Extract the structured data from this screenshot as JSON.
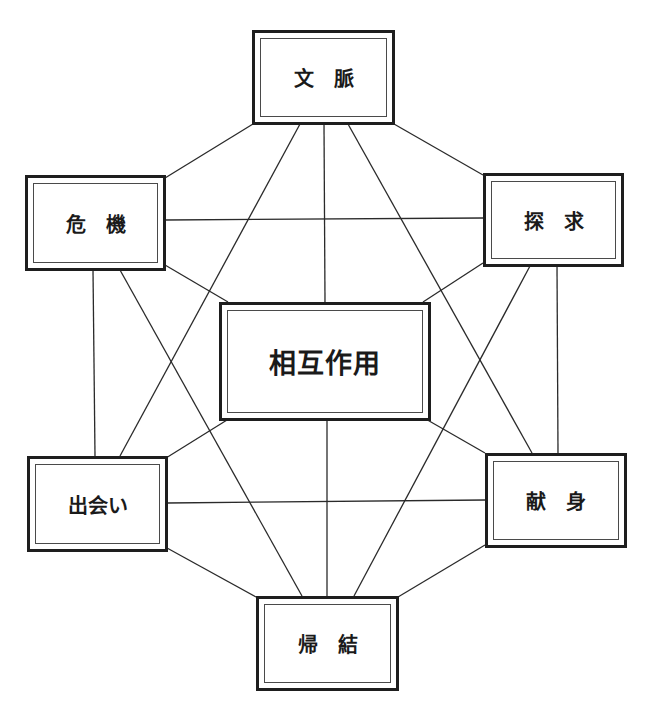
{
  "diagram": {
    "type": "concept-network",
    "colors": {
      "line": "#2a2a2a",
      "border": "#1e1e1e",
      "text": "#1a1a1a",
      "background": "#ffffff"
    },
    "nodes": {
      "top": {
        "id": "context",
        "label": "文　脈"
      },
      "left_top": {
        "id": "crisis",
        "label": "危　機"
      },
      "right_top": {
        "id": "inquiry",
        "label": "探　求"
      },
      "center": {
        "id": "interaction",
        "label": "相互作用"
      },
      "left_bottom": {
        "id": "encounter",
        "label": "出会い"
      },
      "right_bottom": {
        "id": "commitment",
        "label": "献　身"
      },
      "bottom": {
        "id": "consequence",
        "label": "帰　結"
      }
    },
    "edges": [
      [
        "文脈",
        "危機"
      ],
      [
        "文脈",
        "探求"
      ],
      [
        "文脈",
        "相互作用"
      ],
      [
        "文脈",
        "出会い"
      ],
      [
        "文脈",
        "献身"
      ],
      [
        "危機",
        "探求"
      ],
      [
        "危機",
        "相互作用"
      ],
      [
        "危機",
        "出会い"
      ],
      [
        "危機",
        "帰結"
      ],
      [
        "探求",
        "相互作用"
      ],
      [
        "探求",
        "献身"
      ],
      [
        "探求",
        "帰結"
      ],
      [
        "相互作用",
        "出会い"
      ],
      [
        "相互作用",
        "献身"
      ],
      [
        "相互作用",
        "帰結"
      ],
      [
        "出会い",
        "献身"
      ],
      [
        "出会い",
        "帰結"
      ],
      [
        "献身",
        "帰結"
      ]
    ]
  }
}
